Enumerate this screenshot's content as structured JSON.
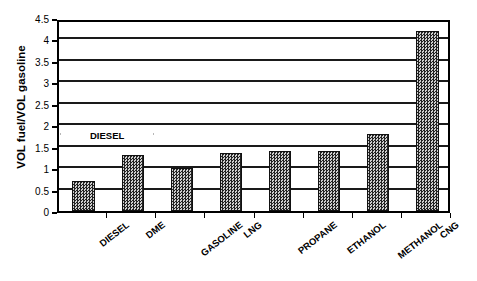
{
  "chart_data": {
    "type": "bar",
    "title": "",
    "xlabel": "",
    "ylabel": "VOL fuel/VOL gasoline",
    "categories": [
      "DIESEL",
      "DME",
      "GASOLINE",
      "LNG",
      "PROPANE",
      "ETHANOL",
      "METHANOL",
      "CNG"
    ],
    "values": [
      0.7,
      1.3,
      1.0,
      1.35,
      1.4,
      1.4,
      1.8,
      4.2
    ],
    "ylim": [
      0,
      4.5
    ],
    "ytick_labels": [
      "0",
      "0.5",
      "1",
      "1.5",
      "2",
      "2.5",
      "3",
      "3.5",
      "4",
      "4.5"
    ],
    "ytick_values": [
      0,
      0.5,
      1,
      1.5,
      2,
      2.5,
      3,
      3.5,
      4,
      4.5
    ],
    "grid": true,
    "legend": "none",
    "annotations": [
      {
        "label": "DIESEL",
        "type": "double-arrow-range",
        "from_category": "DIESEL",
        "to_category": "DME",
        "y_value": 1.8
      }
    ],
    "bar_fill": "#4d4d4d",
    "axis_color": "#000000"
  }
}
